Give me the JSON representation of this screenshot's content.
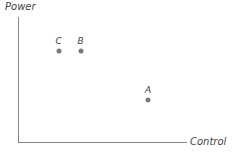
{
  "chart_data": {
    "type": "scatter",
    "title": "",
    "xlabel": "Control",
    "ylabel": "Power",
    "grid": false,
    "legend": null,
    "points": [
      {
        "label": "C",
        "x": 0.24,
        "y": 0.73
      },
      {
        "label": "B",
        "x": 0.37,
        "y": 0.73
      },
      {
        "label": "A",
        "x": 0.77,
        "y": 0.34
      }
    ],
    "xlim": [
      0,
      1
    ],
    "ylim": [
      0,
      1
    ],
    "point_color": "#7a7a7a",
    "axis_color": "#888888"
  }
}
